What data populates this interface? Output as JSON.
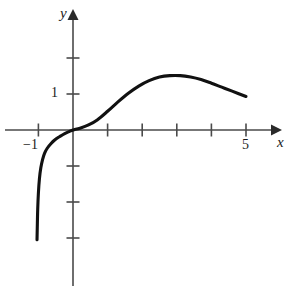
{
  "figure": {
    "kind": "cartesian-graph",
    "width": 292,
    "height": 289,
    "background_color": "#ffffff",
    "curve_color": "#111111",
    "axis_color": "#4a4a4a"
  },
  "labels": {
    "y_axis": "y",
    "x_axis": "x",
    "y_tick_1": "1",
    "x_tick_neg1": "−1",
    "x_tick_5": "5"
  },
  "chart_data": {
    "type": "line",
    "title": "",
    "xlabel": "x",
    "ylabel": "y",
    "grid": false,
    "legend": null,
    "xlim": [
      -1.95,
      5.85
    ],
    "ylim": [
      -4.4,
      3.35
    ],
    "xticks": [
      -1,
      1,
      2,
      3,
      4,
      5
    ],
    "yticks": [
      -3,
      -2,
      -1,
      1,
      2
    ],
    "xtick_labels": [
      "-1",
      "",
      "",
      "",
      "",
      "5"
    ],
    "ytick_labels": [
      "",
      "",
      "",
      "1",
      ""
    ],
    "origin_px": [
      73,
      130
    ],
    "x_unit_px": 34.6,
    "y_unit_px": 36.0,
    "series": [
      {
        "name": "curve",
        "x": [
          -1.04,
          -1.03,
          -1.02,
          -1.0,
          -0.97,
          -0.93,
          -0.88,
          -0.82,
          -0.74,
          -0.64,
          -0.52,
          -0.38,
          -0.24,
          -0.1,
          0.0,
          0.2,
          0.45,
          0.7,
          1.0,
          1.3,
          1.6,
          1.9,
          2.2,
          2.5,
          2.8,
          3.1,
          3.4,
          3.7,
          4.0,
          4.3,
          4.6,
          5.0
        ],
        "y": [
          -3.05,
          -2.6,
          -2.2,
          -1.75,
          -1.35,
          -1.05,
          -0.82,
          -0.64,
          -0.5,
          -0.38,
          -0.27,
          -0.18,
          -0.1,
          -0.04,
          0.0,
          0.05,
          0.14,
          0.28,
          0.52,
          0.78,
          1.02,
          1.22,
          1.37,
          1.47,
          1.51,
          1.51,
          1.47,
          1.4,
          1.3,
          1.19,
          1.08,
          0.93
        ]
      }
    ],
    "annotations": [
      {
        "text": "y",
        "kind": "axis-name",
        "position": "top of vertical axis"
      },
      {
        "text": "x",
        "kind": "axis-name",
        "position": "right of horizontal axis"
      },
      {
        "text": "1",
        "kind": "tick-label",
        "axis": "y",
        "value": 1
      },
      {
        "text": "-1",
        "kind": "tick-label",
        "axis": "x",
        "value": -1
      },
      {
        "text": "5",
        "kind": "tick-label",
        "axis": "x",
        "value": 5
      }
    ]
  }
}
